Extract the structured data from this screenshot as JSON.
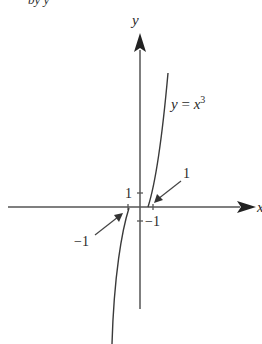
{
  "diagram": {
    "title_fragment": "by y",
    "axes": {
      "x_label": "x",
      "y_label": "y"
    },
    "curve_label": {
      "lhs": "y",
      "eq": " = ",
      "base": "x",
      "exp": "3"
    },
    "ticks": {
      "y_pos": "1",
      "y_neg": "−1",
      "callout_pos": "1",
      "callout_neg": "−1"
    },
    "colors": {
      "axis": "#4a4a4a",
      "curve": "#3a3a3a",
      "text": "#2a2a2a"
    }
  }
}
